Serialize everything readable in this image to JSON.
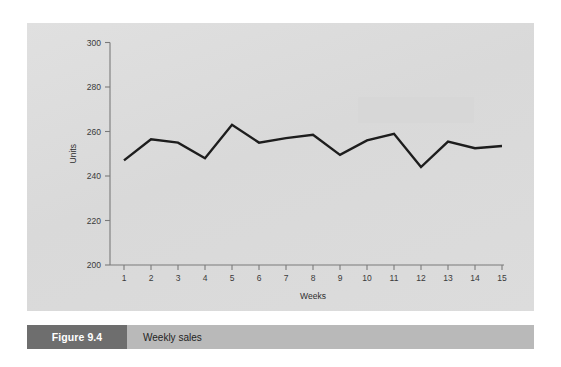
{
  "figure": {
    "number_label": "Figure 9.4",
    "caption": "Weekly sales"
  },
  "colors": {
    "panel_background": "#dddddd",
    "page_background": "#ffffff",
    "data_line": "#1d1d1d",
    "axis": "#7a7a7a",
    "caption_bar": "#b9b9b9",
    "figure_number_block": "#6e6e6e"
  },
  "chart_data": {
    "type": "line",
    "title": "",
    "xlabel": "Weeks",
    "ylabel": "Units",
    "xlim": [
      1,
      15
    ],
    "ylim": [
      200,
      300
    ],
    "ytick_labels": [
      "200",
      "220",
      "240",
      "260",
      "280",
      "300"
    ],
    "yticks": [
      200,
      220,
      240,
      260,
      280,
      300
    ],
    "xtick_labels": [
      "1",
      "2",
      "3",
      "4",
      "5",
      "6",
      "7",
      "8",
      "9",
      "10",
      "11",
      "12",
      "13",
      "14",
      "15"
    ],
    "x": [
      1,
      2,
      3,
      4,
      5,
      6,
      7,
      8,
      9,
      10,
      11,
      12,
      13,
      14,
      15
    ],
    "grid": false,
    "legend": false,
    "series": [
      {
        "name": "Weekly sales",
        "values": [
          247,
          256.5,
          255,
          248,
          263,
          255,
          257,
          258.5,
          249.5,
          256,
          259,
          244,
          255.5,
          252.5,
          253.5
        ]
      }
    ]
  }
}
